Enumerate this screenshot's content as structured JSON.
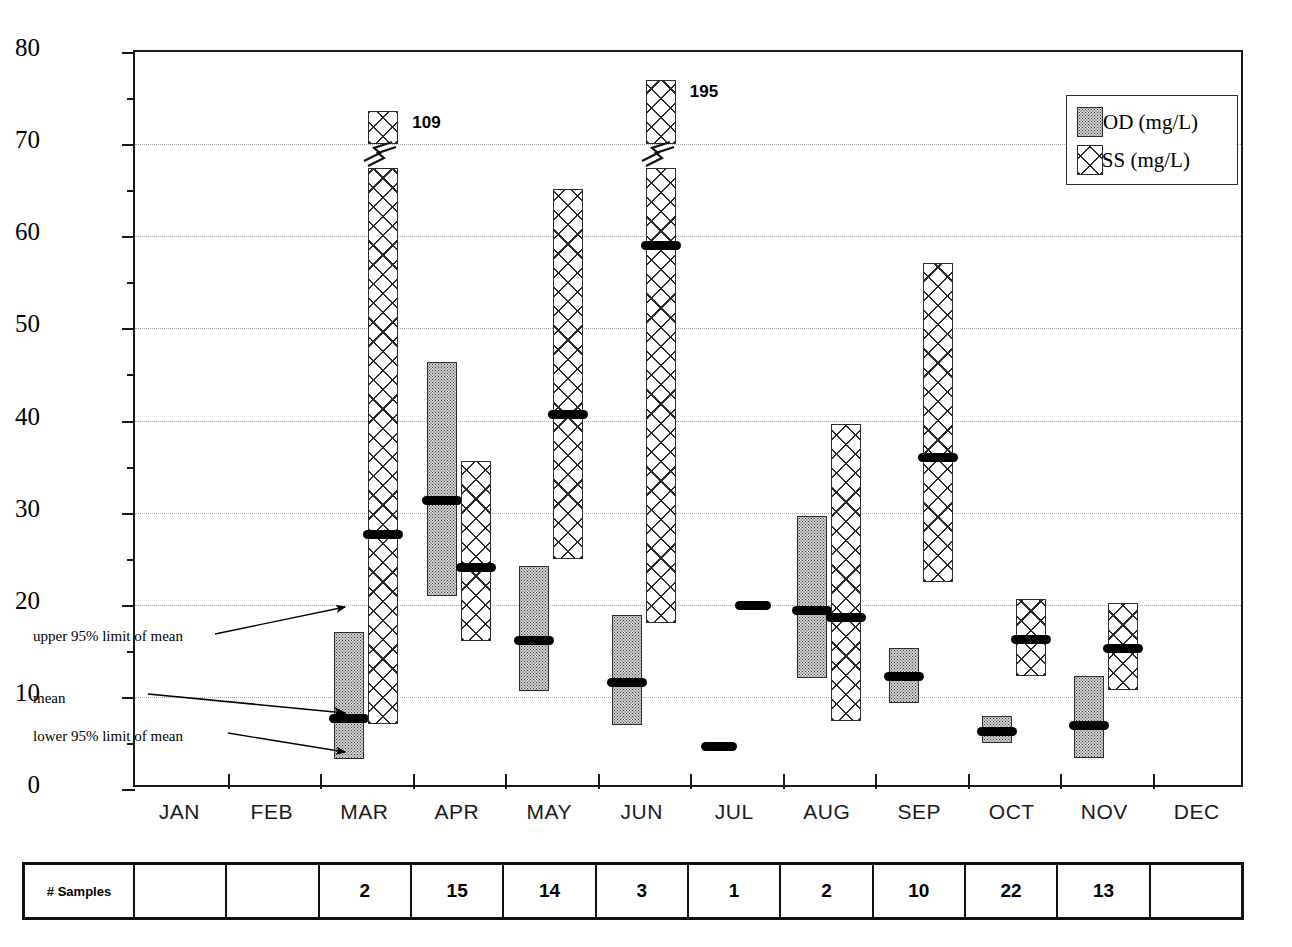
{
  "chart_data": {
    "type": "bar",
    "title": "",
    "xlabel": "",
    "ylabel": "BOD & TSS (mg/L)",
    "ylim": [
      0,
      80
    ],
    "ytick_labels": [
      "0",
      "10",
      "20",
      "30",
      "40",
      "50",
      "60",
      "70",
      "80"
    ],
    "ytick_values": [
      0,
      10,
      20,
      30,
      40,
      50,
      60,
      70,
      80
    ],
    "yminor_values": [
      5,
      15,
      25,
      35,
      45,
      55,
      65,
      75
    ],
    "grid": true,
    "grid_axis": "y",
    "legend_position": "top-right",
    "categories": [
      "JAN",
      "FEB",
      "MAR",
      "APR",
      "MAY",
      "JUN",
      "JUL",
      "AUG",
      "SEP",
      "OCT",
      "NOV",
      "DEC"
    ],
    "series": [
      {
        "name": "BOD (mg/L)",
        "pattern": "stipple",
        "color": "#d2d2d2",
        "points": [
          {
            "category": "JAN",
            "mean": null,
            "lower": null,
            "upper": null
          },
          {
            "category": "FEB",
            "mean": null,
            "lower": null,
            "upper": null
          },
          {
            "category": "MAR",
            "mean": 7.7,
            "lower": 3.3,
            "upper": 17.0
          },
          {
            "category": "APR",
            "mean": 31.3,
            "lower": 21.0,
            "upper": 46.4
          },
          {
            "category": "MAY",
            "mean": 16.1,
            "lower": 10.6,
            "upper": 24.2
          },
          {
            "category": "JUN",
            "mean": 11.6,
            "lower": 7.0,
            "upper": 18.9
          },
          {
            "category": "JUL",
            "mean": 4.6,
            "lower": 4.6,
            "upper": 4.6
          },
          {
            "category": "AUG",
            "mean": 19.4,
            "lower": 12.1,
            "upper": 29.6
          },
          {
            "category": "SEP",
            "mean": 12.2,
            "lower": 9.3,
            "upper": 15.3
          },
          {
            "category": "OCT",
            "mean": 6.2,
            "lower": 5.0,
            "upper": 7.9
          },
          {
            "category": "NOV",
            "mean": 6.9,
            "lower": 3.4,
            "upper": 12.3
          },
          {
            "category": "DEC",
            "mean": null,
            "lower": null,
            "upper": null
          }
        ]
      },
      {
        "name": "TSS (mg/L)",
        "pattern": "crosshatch",
        "color": "#ffffff",
        "points": [
          {
            "category": "JAN",
            "mean": null,
            "lower": null,
            "upper": null,
            "upper_label": null
          },
          {
            "category": "FEB",
            "mean": null,
            "lower": null,
            "upper": null,
            "upper_label": null
          },
          {
            "category": "MAR",
            "mean": 27.6,
            "lower": 7.1,
            "upper": 109,
            "upper_label": "109",
            "broken": true
          },
          {
            "category": "APR",
            "mean": 24.0,
            "lower": 16.1,
            "upper": 35.6,
            "upper_label": null
          },
          {
            "category": "MAY",
            "mean": 40.6,
            "lower": 25.0,
            "upper": 65.1,
            "upper_label": null
          },
          {
            "category": "JUN",
            "mean": 59.0,
            "lower": 18.0,
            "upper": 195,
            "upper_label": "195",
            "broken": true
          },
          {
            "category": "JUL",
            "mean": 19.9,
            "lower": 19.9,
            "upper": 19.9,
            "upper_label": null
          },
          {
            "category": "AUG",
            "mean": 18.6,
            "lower": 7.4,
            "upper": 39.6,
            "upper_label": null
          },
          {
            "category": "SEP",
            "mean": 36.0,
            "lower": 22.5,
            "upper": 57.1,
            "upper_label": null
          },
          {
            "category": "OCT",
            "mean": 16.2,
            "lower": 12.3,
            "upper": 20.6,
            "upper_label": null
          },
          {
            "category": "NOV",
            "mean": 15.2,
            "lower": 10.8,
            "upper": 20.2,
            "upper_label": null
          },
          {
            "category": "DEC",
            "mean": null,
            "lower": null,
            "upper": null,
            "upper_label": null
          }
        ]
      }
    ],
    "annotations": [
      {
        "text": "upper 95% limit of mean",
        "target": "MAR BOD upper"
      },
      {
        "text": "mean",
        "target": "MAR BOD mean"
      },
      {
        "text": "lower 95% limit of mean",
        "target": "MAR BOD lower"
      }
    ]
  },
  "legend": {
    "items": [
      {
        "label": "BOD (mg/L)"
      },
      {
        "label": "TSS (mg/L)"
      }
    ]
  },
  "annotations": {
    "upper": "upper 95% limit of mean",
    "mean": "mean",
    "lower": "lower 95% limit of mean"
  },
  "overlabels": {
    "mar_tss": "109",
    "jun_tss": "195"
  },
  "sample_table": {
    "row_header": "# Samples",
    "values": [
      "",
      "",
      "2",
      "15",
      "14",
      "3",
      "1",
      "2",
      "10",
      "22",
      "13",
      ""
    ]
  }
}
